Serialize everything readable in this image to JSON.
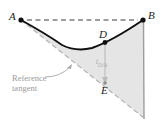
{
  "figure": {
    "name": "beam-deflection-moment-area-diagram",
    "type": "engineering-beam-deflection",
    "width": 160,
    "height": 123,
    "background_color": "#ffffff"
  },
  "points": {
    "A": {
      "label": "A",
      "x": 21,
      "y": 20
    },
    "B": {
      "label": "B",
      "x": 143,
      "y": 20
    },
    "D": {
      "label": "D",
      "x": 105,
      "y": 42
    },
    "E": {
      "label": "E",
      "x": 105,
      "y": 83
    }
  },
  "annotations": {
    "reference_tangent_line1": "Reference",
    "reference_tangent_line2": "tangent",
    "deviation_symbol": "t",
    "deviation_subscript": "D/A"
  },
  "colors": {
    "curve": "#111111",
    "dashed_chord": "#3a3a3a",
    "tangent_line": "#b0b0b0",
    "vertical_line": "#9a9a9a",
    "shaded_region": "#e4e4e4",
    "point_marker": "#111111",
    "gray_text": "#9a9a9a",
    "black_text": "#1a1a1a",
    "arrow": "#b4b4b4",
    "leader": "#a5a5a5"
  },
  "geometry": {
    "chord_AB": {
      "x1": 26,
      "y1": 20,
      "x2": 139,
      "y2": 20
    },
    "elastic_curve_path": "M 21 20 Q 48 35 62 45 Q 76 52 92 48 Q 112 41 143 20",
    "reference_tangent": {
      "x1": 21,
      "y1": 20,
      "x2": 144,
      "y2": 118
    },
    "vertical_at_B": {
      "x1": 143,
      "y1": 20,
      "x2": 144,
      "y2": 119
    },
    "deviation_arrow": {
      "x1": 105,
      "y1": 43,
      "x2": 105,
      "y2": 83
    },
    "leader_line": "M 44 77 Q 60 76 71 66",
    "shaded_polygon": "M 21 20 L 144 118 L 143 20 Q 112 41 92 48 Q 76 52 62 45 Q 48 35 21 20 Z"
  }
}
